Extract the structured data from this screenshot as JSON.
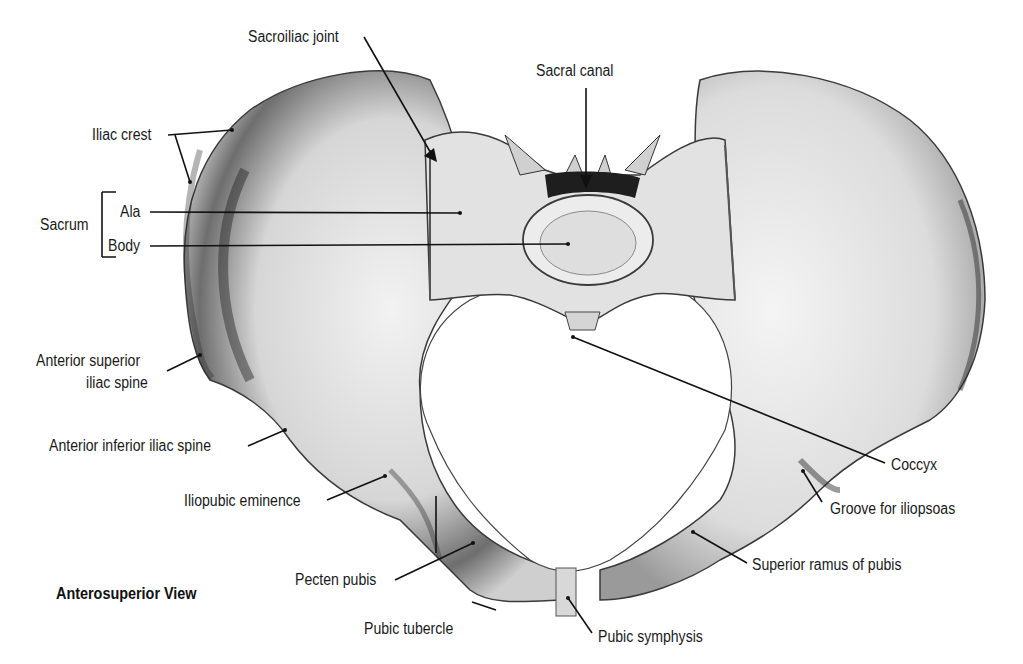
{
  "figure": {
    "view_caption": "Anterosuperior View",
    "colors": {
      "bone_light": "#e8e8e8",
      "bone_mid": "#bdbdbd",
      "bone_dark": "#2a2a2a",
      "leader": "#111111",
      "background": "#ffffff"
    }
  },
  "labels": {
    "sacroiliac_joint": "Sacroiliac joint",
    "sacral_canal": "Sacral canal",
    "iliac_crest": "Iliac crest",
    "sacrum": "Sacrum",
    "ala": "Ala",
    "body": "Body",
    "asis_line1": "Anterior superior",
    "asis_line2": "iliac spine",
    "aiis": "Anterior inferior iliac spine",
    "iliopubic_eminence": "Iliopubic eminence",
    "pecten_pubis": "Pecten pubis",
    "pubic_tubercle": "Pubic tubercle",
    "pubic_symphysis": "Pubic symphysis",
    "superior_ramus": "Superior ramus of pubis",
    "groove_iliopsoas": "Groove for iliopsoas",
    "coccyx": "Coccyx"
  }
}
